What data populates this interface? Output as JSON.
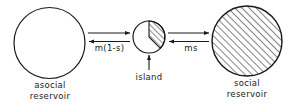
{
  "figure": {
    "type": "flow-diagram",
    "background_color": "#ffffff",
    "stroke_color": "#1a1a1a"
  },
  "nodes": [
    {
      "id": "asocial-reservoir",
      "label_line1": "asocial",
      "label_line2": "reservoir",
      "shape": "circle",
      "fill": "white",
      "hatched": false,
      "cx": 49.5,
      "cy": 43,
      "r": 35.5
    },
    {
      "id": "island",
      "label_line1": "island",
      "label_line2": "",
      "shape": "pie-circle",
      "fill": "white",
      "hatched_wedge": true,
      "wedge_start_deg": 0,
      "wedge_end_deg": 135,
      "cx": 149,
      "cy": 37,
      "r": 16
    },
    {
      "id": "social-reservoir",
      "label_line1": "social",
      "label_line2": "reservoir",
      "shape": "circle",
      "fill": "hatched",
      "hatched": true,
      "cx": 247,
      "cy": 41,
      "r": 35
    }
  ],
  "arrows": [
    {
      "id": "asocial-to-island",
      "direction": "right",
      "from": "asocial-reservoir",
      "to": "island",
      "label": ""
    },
    {
      "id": "island-to-asocial",
      "direction": "left",
      "from": "island",
      "to": "asocial-reservoir",
      "label": "m(1-s)"
    },
    {
      "id": "island-to-social",
      "direction": "right",
      "from": "island",
      "to": "social-reservoir",
      "label": ""
    },
    {
      "id": "social-to-island",
      "direction": "left",
      "from": "social-reservoir",
      "to": "island",
      "label": "ms"
    },
    {
      "id": "island-pointer",
      "direction": "up",
      "from": "island-label",
      "to": "island",
      "label": ""
    }
  ],
  "flow_labels": {
    "left": "m(1-s)",
    "right": "ms"
  }
}
